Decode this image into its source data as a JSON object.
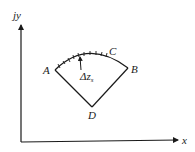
{
  "diagram": {
    "axes": {
      "y_label": "jy",
      "x_label": "x"
    },
    "points": {
      "A": "A",
      "B": "B",
      "C": "C",
      "D": "D"
    },
    "segment_label_main": "Δz",
    "segment_label_sub": "s",
    "colors": {
      "stroke": "#1a1a1a",
      "background": "#ffffff"
    }
  }
}
